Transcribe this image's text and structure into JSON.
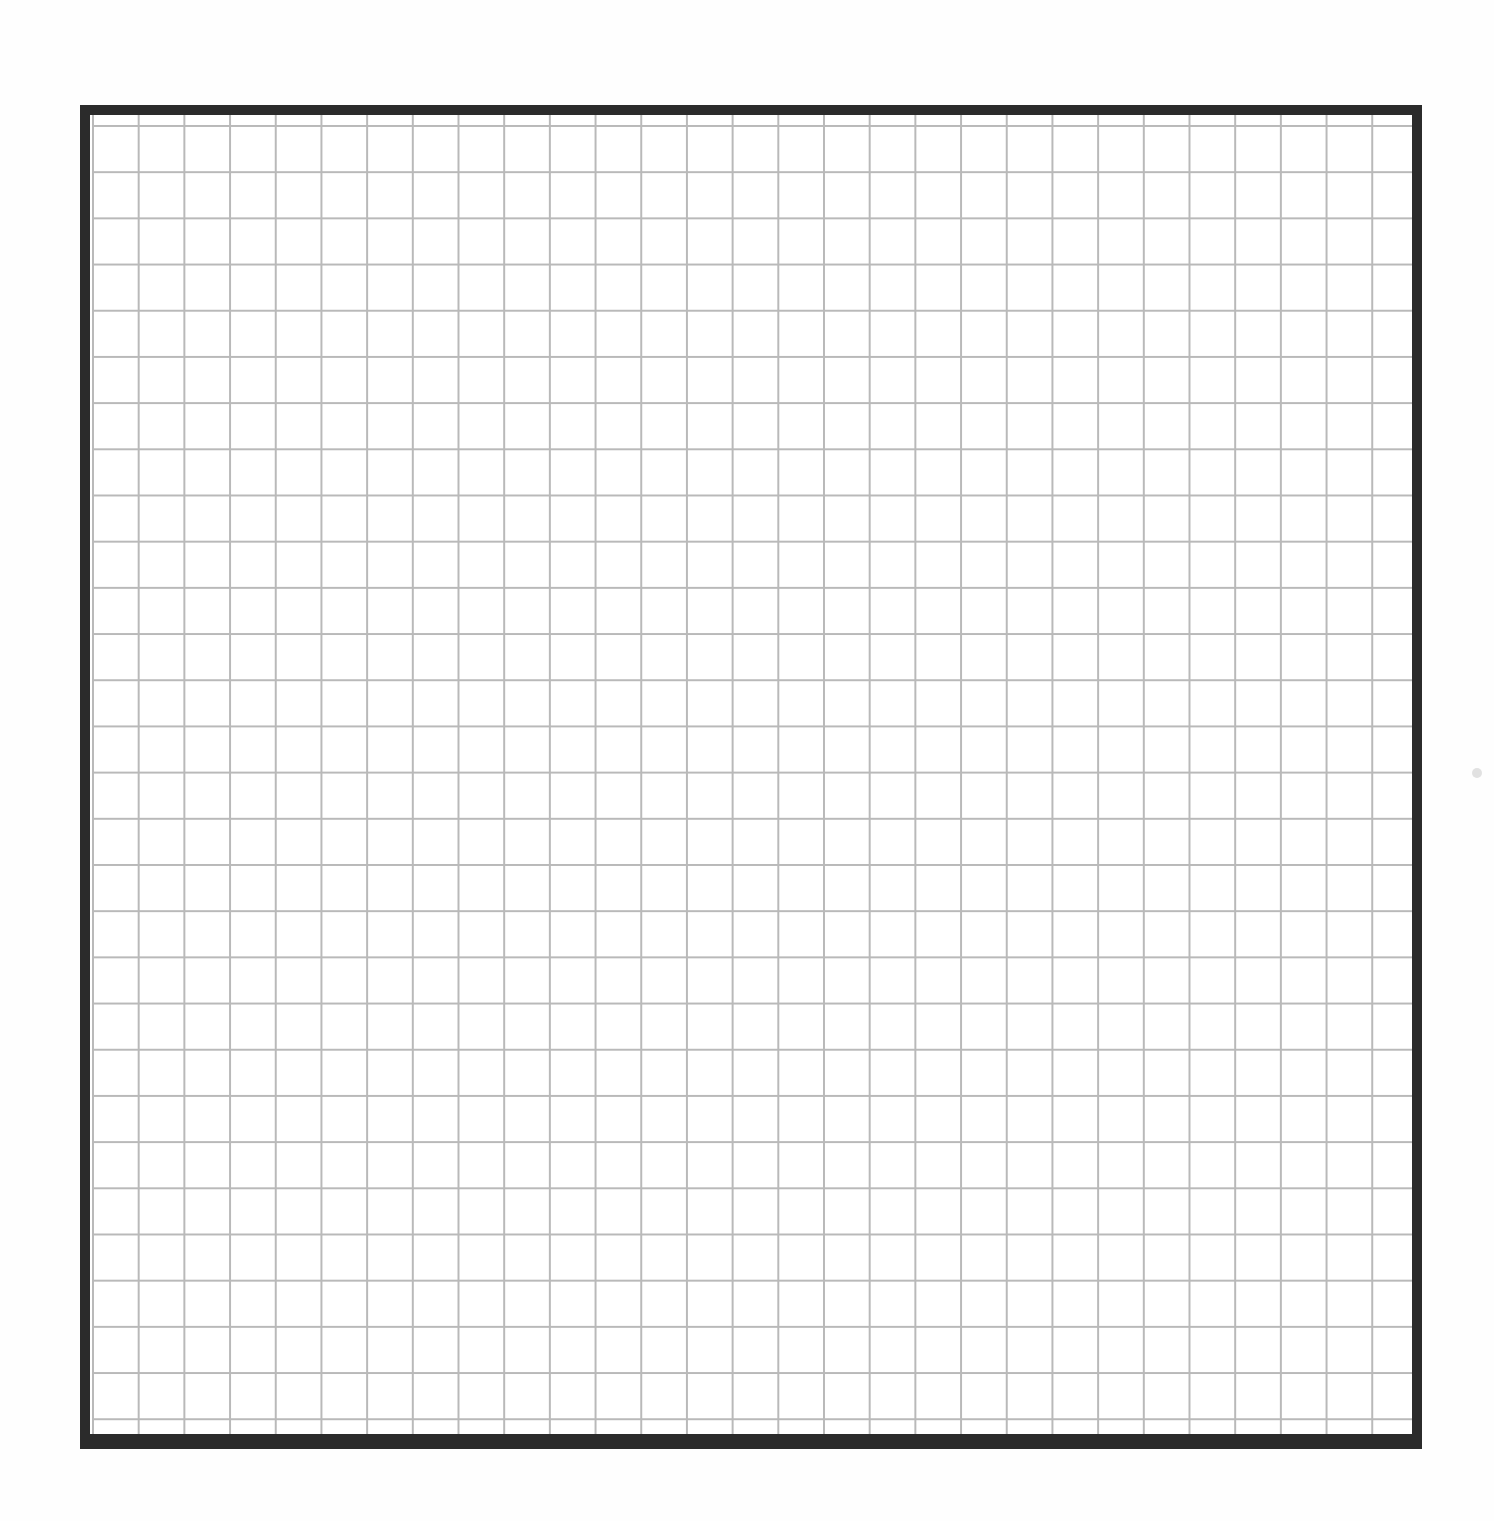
{
  "document": {
    "type": "graph-paper",
    "description": "Blank square grid within a thick dark border",
    "grid": {
      "columns": 29,
      "rows": 29,
      "cell_size_px": 46,
      "line_color": "#b9b9b9"
    },
    "frame": {
      "border_color": "#2b2b2b",
      "background_color": "#ffffff"
    },
    "content_text": ""
  }
}
